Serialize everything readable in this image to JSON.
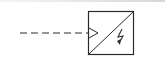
{
  "diagram": {
    "type": "electrical-symbol",
    "symbol": "dc-dc-converter-or-inverter",
    "input_line": "dashed",
    "input_marker": "open-arrow",
    "box_content": [
      "diagonal-divider",
      "lightning-bolt-icon"
    ],
    "colors": {
      "stroke": "#2a2a2a",
      "background": "#ffffff",
      "top_border": "#d8d8d8"
    }
  }
}
